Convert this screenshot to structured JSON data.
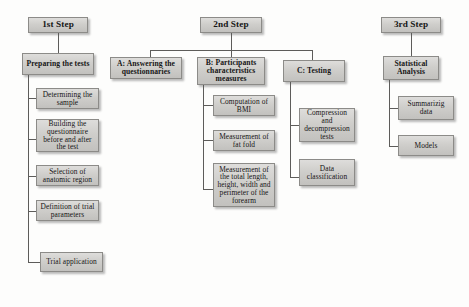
{
  "diagram": {
    "background_color": "#fdfdfc",
    "box_fill": "#cfcecb",
    "box_border": "#8c8b88",
    "connector_color": "#5d5c5a",
    "columns": [
      {
        "id": "step1",
        "head": {
          "label": "1st Step"
        },
        "root": {
          "label": "Preparing the tests"
        },
        "children": [
          {
            "label": "Determining the sample"
          },
          {
            "label": "Building the questionnaire before and after the test"
          },
          {
            "label": "Selection of anatomic region"
          },
          {
            "label": "Definition of trial parameters"
          },
          {
            "label": "Trial application"
          }
        ]
      },
      {
        "id": "step2",
        "head": {
          "label": "2nd Step"
        },
        "branches": [
          {
            "id": "branch-a",
            "label": "A: Answering the questionnaries",
            "children": []
          },
          {
            "id": "branch-b",
            "label": "B: Participants characteristics measures",
            "children": [
              {
                "label": "Computation of BMI"
              },
              {
                "label": "Measurement of fat fold"
              },
              {
                "label": "Measurement of the total length, height, width and perimeter of the forearm"
              }
            ]
          },
          {
            "id": "branch-c",
            "label": "C: Testing",
            "children": [
              {
                "label": "Compression and decompression tests"
              },
              {
                "label": "Data classification"
              }
            ]
          }
        ]
      },
      {
        "id": "step3",
        "head": {
          "label": "3rd Step"
        },
        "root": {
          "label": "Statistical Analysis"
        },
        "children": [
          {
            "label": "Summarizig data"
          },
          {
            "label": "Models"
          }
        ]
      }
    ]
  }
}
